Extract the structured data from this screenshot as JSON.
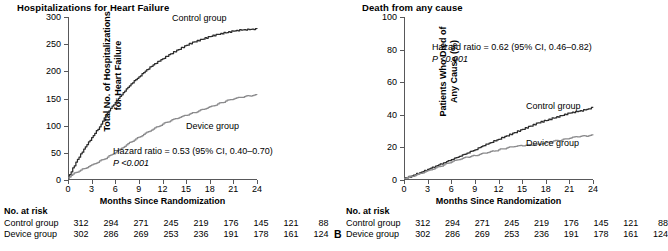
{
  "figure": {
    "x_ticks": [
      0,
      3,
      6,
      9,
      12,
      15,
      18,
      21,
      24
    ],
    "xlabel": "Months Since Randomization",
    "risk_title": "No. at risk",
    "colors": {
      "control": "#2b2b2b",
      "device": "#8a8a8c",
      "axis": "#58585a"
    }
  },
  "panels": [
    {
      "letter": "",
      "title": "Hospitalizations for Heart Failure",
      "ylabel": "Total No. of Hospitalizations\nfor Heart Failure",
      "y_ticks": [
        0,
        50,
        100,
        150,
        200,
        250,
        300
      ],
      "ylim": [
        0,
        300
      ],
      "annotation_line1": "Hazard ratio = 0.53 (95% CI, 0.40–0.70)",
      "annotation_line2": "P <0.001",
      "control_label": "Control group",
      "device_label": "Device group",
      "risk_rows": [
        {
          "name": "Control group",
          "values": [
            312,
            294,
            271,
            245,
            219,
            176,
            145,
            121,
            88
          ]
        },
        {
          "name": "Device group",
          "values": [
            302,
            286,
            269,
            253,
            236,
            191,
            178,
            161,
            124
          ]
        }
      ]
    },
    {
      "letter": "B",
      "title": "Death from any cause",
      "ylabel": "Patients Who Died of\nAny Cause (%)",
      "y_ticks": [
        0,
        20,
        40,
        60,
        80,
        100
      ],
      "ylim": [
        0,
        100
      ],
      "annotation_line1": "Hazard ratio = 0.62 (95% CI, 0.46–0.82)",
      "annotation_line2": "P <0.001",
      "control_label": "Control group",
      "device_label": "Device group",
      "risk_rows": [
        {
          "name": "Control group",
          "values": [
            312,
            294,
            271,
            245,
            219,
            176,
            145,
            121,
            88
          ]
        },
        {
          "name": "Device group",
          "values": [
            302,
            286,
            269,
            253,
            236,
            191,
            178,
            161,
            124
          ]
        }
      ]
    }
  ],
  "chart_data": [
    {
      "type": "line",
      "title": "Hospitalizations for Heart Failure",
      "xlabel": "Months Since Randomization",
      "ylabel": "Total No. of Hospitalizations for Heart Failure",
      "xlim": [
        0,
        24
      ],
      "ylim": [
        0,
        300
      ],
      "xticks": [
        0,
        3,
        6,
        9,
        12,
        15,
        18,
        21,
        24
      ],
      "yticks": [
        0,
        50,
        100,
        150,
        200,
        250,
        300
      ],
      "grid": false,
      "legend": "inline-annotation",
      "annotations": [
        "Hazard ratio = 0.53 (95% CI, 0.40–0.70)",
        "P <0.001"
      ],
      "x": [
        0,
        1,
        2,
        3,
        4,
        5,
        6,
        7,
        8,
        9,
        10,
        11,
        12,
        13,
        14,
        15,
        16,
        17,
        18,
        19,
        20,
        21,
        22,
        23,
        24
      ],
      "series": [
        {
          "name": "Control group",
          "color": "#2b2b2b",
          "values": [
            4,
            33,
            57,
            78,
            98,
            124,
            143,
            161,
            177,
            190,
            203,
            214,
            223,
            232,
            240,
            248,
            254,
            259,
            264,
            268,
            271,
            274,
            276,
            277,
            278
          ]
        },
        {
          "name": "Device group",
          "color": "#8a8a8c",
          "values": [
            4,
            14,
            21,
            28,
            35,
            42,
            50,
            60,
            70,
            79,
            88,
            96,
            103,
            109,
            114,
            119,
            124,
            130,
            135,
            140,
            145,
            149,
            152,
            155,
            157
          ]
        }
      ]
    },
    {
      "type": "line",
      "title": "Death from any cause",
      "xlabel": "Months Since Randomization",
      "ylabel": "Patients Who Died of Any Cause (%)",
      "xlim": [
        0,
        24
      ],
      "ylim": [
        0,
        100
      ],
      "xticks": [
        0,
        3,
        6,
        9,
        12,
        15,
        18,
        21,
        24
      ],
      "yticks": [
        0,
        20,
        40,
        60,
        80,
        100
      ],
      "grid": false,
      "legend": "inline-annotation",
      "annotations": [
        "Hazard ratio = 0.62 (95% CI, 0.46–0.82)",
        "P <0.001"
      ],
      "x": [
        0,
        1,
        2,
        3,
        4,
        5,
        6,
        7,
        8,
        9,
        10,
        11,
        12,
        13,
        14,
        15,
        16,
        17,
        18,
        19,
        20,
        21,
        22,
        23,
        24
      ],
      "series": [
        {
          "name": "Control group",
          "color": "#2b2b2b",
          "values": [
            1,
            2.5,
            4.5,
            6.5,
            8.5,
            10.5,
            12.5,
            14.5,
            16.5,
            18.5,
            21,
            23,
            25,
            27,
            29,
            31,
            33,
            35,
            36.5,
            38,
            39.5,
            41,
            42,
            43,
            44.5
          ]
        },
        {
          "name": "Device group",
          "color": "#8a8a8c",
          "values": [
            1,
            2.2,
            4,
            5.8,
            7.5,
            9.2,
            11,
            12.5,
            14,
            15,
            16.5,
            17.5,
            18.5,
            19.5,
            20.5,
            21,
            21.5,
            22,
            23,
            24,
            24.5,
            25.5,
            26.5,
            27,
            27.5
          ]
        }
      ]
    }
  ]
}
